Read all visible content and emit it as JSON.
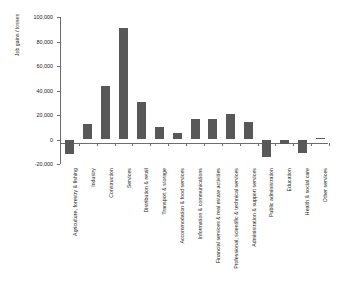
{
  "chart_data": {
    "type": "bar",
    "title": "",
    "xlabel": "",
    "ylabel": "Job gains / losses",
    "ylim": [
      -20000,
      100000
    ],
    "ytick_labels": [
      "100,000",
      "80,000",
      "60,000",
      "40,000",
      "20,000",
      "0",
      "-20,000"
    ],
    "ytick_values": [
      100000,
      80000,
      60000,
      40000,
      20000,
      0,
      -20000
    ],
    "grid": false,
    "legend": "none",
    "bar_color": "#585858",
    "axis_color": "#6d6d6d",
    "categories": [
      "Agriculture, forestry & fishing",
      "Industry",
      "Construction",
      "Services",
      "Distribution & retail",
      "Transport & storage",
      "Accommodation & food services",
      "Information & communications",
      "Financial services & real estate activities",
      "Professional, scientific & technical services",
      "Administration & support services",
      "Public administration",
      "Education",
      "Health & social care",
      "Other services"
    ],
    "values": [
      -12000,
      13000,
      43500,
      91000,
      30500,
      10500,
      5500,
      17000,
      17000,
      20500,
      14000,
      -14000,
      -4000,
      -11000,
      1000
    ]
  }
}
